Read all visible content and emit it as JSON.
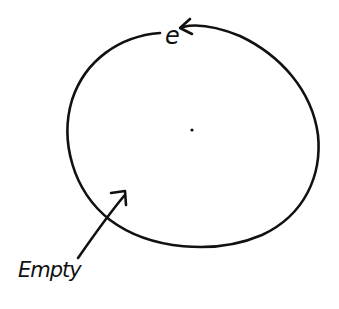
{
  "diagram": {
    "labels": {
      "top": "e",
      "bottom_left": "Empty"
    },
    "colors": {
      "stroke": "#111111",
      "background": "#ffffff"
    },
    "shapes": {
      "circle": "closed loop with small gap at top where label 'e' sits, arrowhead pointing into 'e'",
      "center_dot": "small dot at center",
      "pointer_arrow": "arrow from 'Empty' label pointing into circle interior"
    }
  }
}
